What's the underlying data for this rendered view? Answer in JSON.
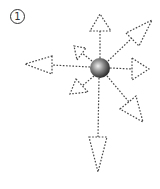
{
  "figure": {
    "number_label": "1",
    "colors": {
      "stroke": "#444444",
      "sphere_light": "#eeeeee",
      "sphere_dark": "#222222",
      "background": "#ffffff"
    },
    "center": [
      100,
      68
    ],
    "vectors": [
      {
        "name": "up",
        "tip": [
          100,
          14
        ]
      },
      {
        "name": "upper-right",
        "tip": [
          152,
          20
        ]
      },
      {
        "name": "right",
        "tip": [
          149,
          69
        ]
      },
      {
        "name": "lower-right",
        "tip": [
          143,
          122
        ]
      },
      {
        "name": "down",
        "tip": [
          98,
          172
        ]
      },
      {
        "name": "left",
        "tip": [
          25,
          64
        ]
      },
      {
        "name": "upper-left-short",
        "tip": [
          74,
          48
        ]
      },
      {
        "name": "lower-left-short",
        "tip": [
          70,
          84
        ]
      }
    ]
  }
}
